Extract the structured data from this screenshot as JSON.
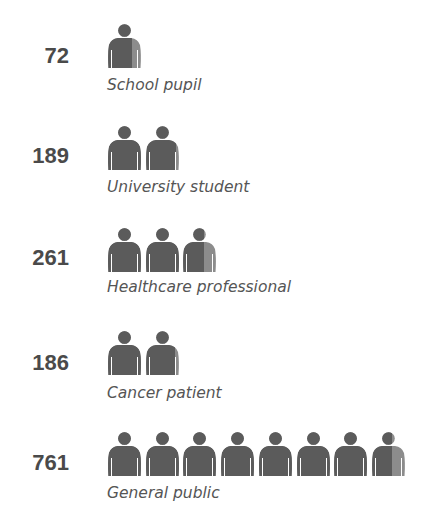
{
  "chart_data": {
    "type": "pictogram",
    "title": "",
    "unit_per_icon": 100,
    "colors": {
      "filled": "#5b5b5b",
      "remainder": "#8c8c8c"
    },
    "categories": [
      "School pupil",
      "University student",
      "Healthcare professional",
      "Cancer patient",
      "General public"
    ],
    "values": [
      72,
      189,
      261,
      186,
      761
    ]
  },
  "rows": [
    {
      "value": "72",
      "label": "School pupil"
    },
    {
      "value": "189",
      "label": "University student"
    },
    {
      "value": "261",
      "label": "Healthcare professional"
    },
    {
      "value": "186",
      "label": "Cancer patient"
    },
    {
      "value": "761",
      "label": "General public"
    }
  ]
}
